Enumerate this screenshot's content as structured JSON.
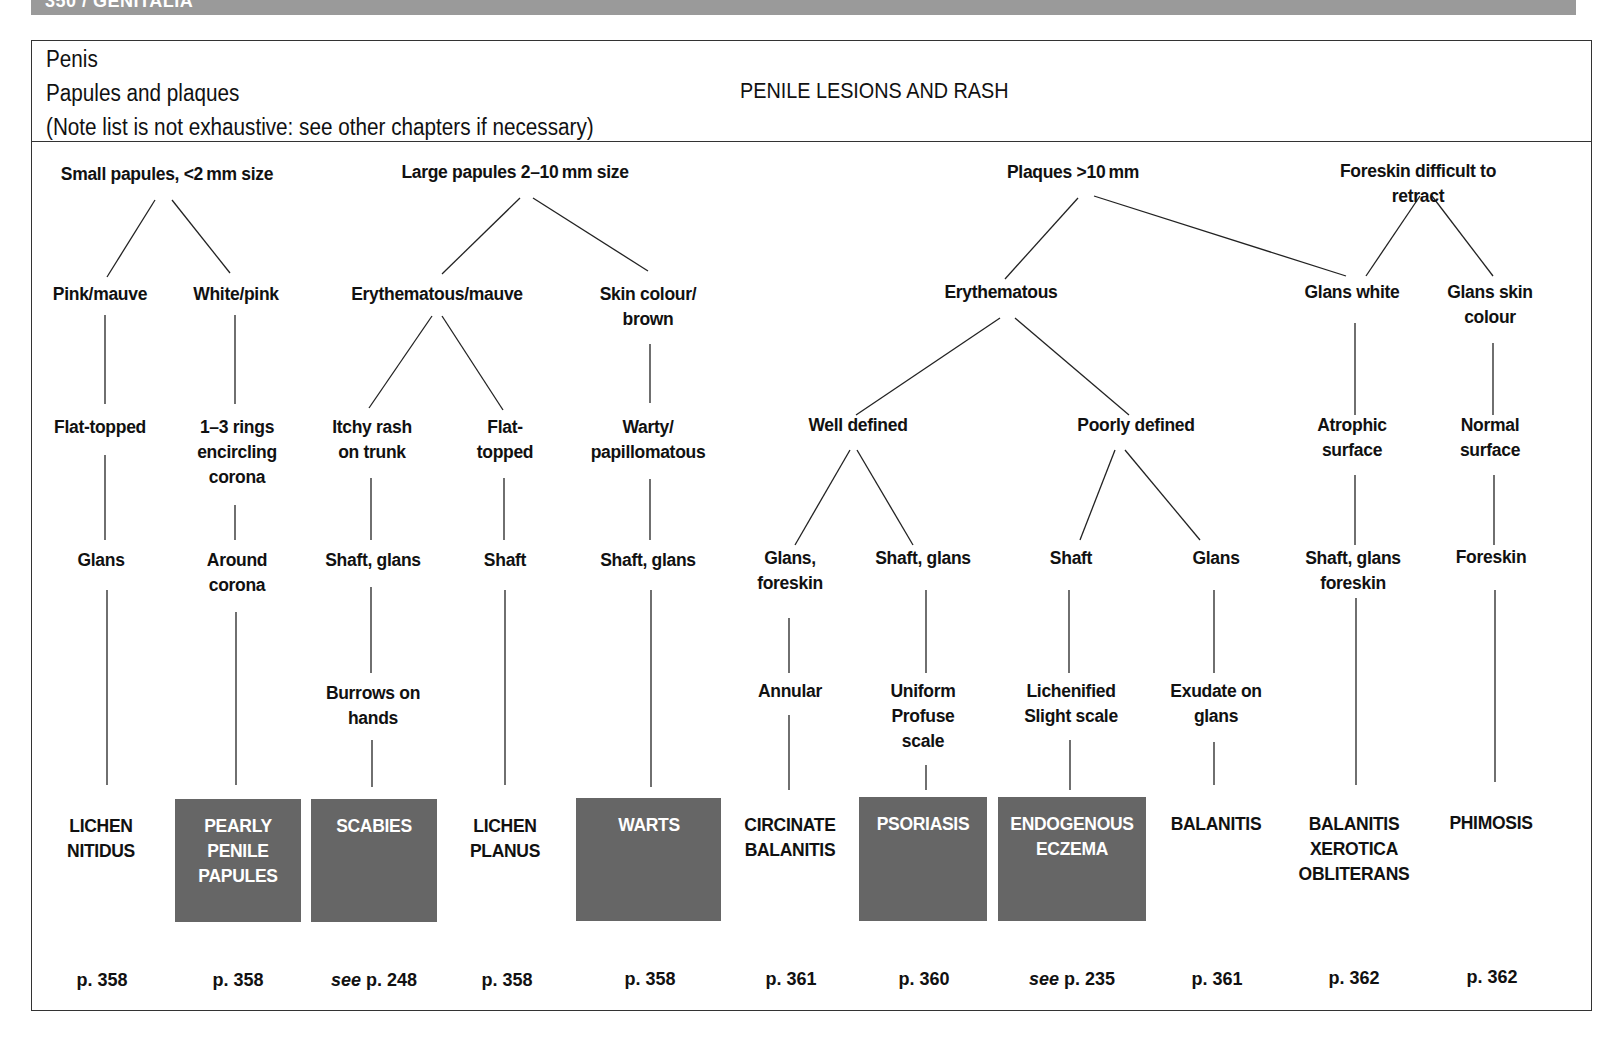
{
  "running_header": "350 / GENITALIA",
  "header": {
    "lines": [
      "Penis",
      "Papules and plaques",
      "(Note list is not exhaustive: see other chapters if necessary)"
    ],
    "title": "PENILE LESIONS AND RASH"
  },
  "colors": {
    "diagnosis_box": "#666666",
    "header_bar": "#9a9a9a",
    "box_text": "#ffffff"
  },
  "categories": [
    {
      "id": "small",
      "label": "Small papules, <2 mm size"
    },
    {
      "id": "large",
      "label": "Large papules 2–10 mm size"
    },
    {
      "id": "plaques",
      "label": "Plaques >10 mm"
    },
    {
      "id": "foreskin",
      "label": "Foreskin difficult to retract"
    }
  ],
  "nodes": {
    "pink_mauve": "Pink/mauve",
    "white_pink": "White/pink",
    "erythematous_mauve": "Erythematous/mauve",
    "skin_colour_brown": "Skin colour/\nbrown",
    "erythematous": "Erythematous",
    "glans_white": "Glans white",
    "glans_skin_colour": "Glans skin\ncolour",
    "flat_topped_1": "Flat-topped",
    "rings": "1–3 rings\nencircling\ncorona",
    "itchy_rash": "Itchy rash\non trunk",
    "flat_topped_2": "Flat-\ntopped",
    "warty": "Warty/\npapillomatous",
    "well_defined": "Well defined",
    "poorly_defined": "Poorly defined",
    "atrophic": "Atrophic\nsurface",
    "normal_surface": "Normal\nsurface",
    "glans_1": "Glans",
    "around_corona": "Around\ncorona",
    "shaft_glans_1": "Shaft, glans",
    "shaft_1": "Shaft",
    "shaft_glans_2": "Shaft, glans",
    "glans_foreskin": "Glans,\nforeskin",
    "shaft_glans_3": "Shaft, glans",
    "shaft_2": "Shaft",
    "glans_2": "Glans",
    "shaft_glans_foreskin": "Shaft, glans\nforeskin",
    "foreskin": "Foreskin",
    "burrows": "Burrows on\nhands",
    "annular": "Annular",
    "uniform": "Uniform\nProfuse\nscale",
    "lichenified": "Lichenified\nSlight scale",
    "exudate": "Exudate on\nglans"
  },
  "diagnoses": [
    {
      "name": "LICHEN\nNITIDUS",
      "boxed": false,
      "page_prefix": "",
      "page": "p. 358"
    },
    {
      "name": "PEARLY\nPENILE\nPAPULES",
      "boxed": true,
      "page_prefix": "",
      "page": "p. 358"
    },
    {
      "name": "SCABIES",
      "boxed": true,
      "page_prefix": "see",
      "page": " p. 248"
    },
    {
      "name": "LICHEN\nPLANUS",
      "boxed": false,
      "page_prefix": "",
      "page": "p. 358"
    },
    {
      "name": "WARTS",
      "boxed": true,
      "page_prefix": "",
      "page": "p. 358"
    },
    {
      "name": "CIRCINATE\nBALANITIS",
      "boxed": false,
      "page_prefix": "",
      "page": "p. 361"
    },
    {
      "name": "PSORIASIS",
      "boxed": true,
      "page_prefix": "",
      "page": "p. 360"
    },
    {
      "name": "ENDOGENOUS\nECZEMA",
      "boxed": true,
      "page_prefix": "see",
      "page": " p. 235"
    },
    {
      "name": "BALANITIS",
      "boxed": false,
      "page_prefix": "",
      "page": "p. 361"
    },
    {
      "name": "BALANITIS\nXEROTICA\nOBLITERANS",
      "boxed": false,
      "page_prefix": "",
      "page": "p. 362"
    },
    {
      "name": "PHIMOSIS",
      "boxed": false,
      "page_prefix": "",
      "page": "p. 362"
    }
  ]
}
